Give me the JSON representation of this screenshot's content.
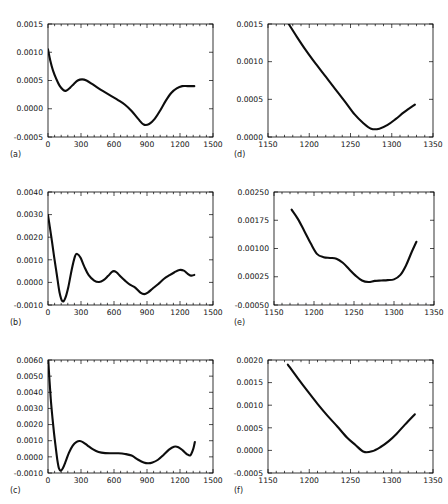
{
  "figure": {
    "background": "#ffffff",
    "curve_color": "#0d0d0d",
    "axis_color": "#000000",
    "panel_count": 6
  },
  "panels": [
    {
      "id": "a",
      "label": "(a)"
    },
    {
      "id": "b",
      "label": "(b)"
    },
    {
      "id": "c",
      "label": "(c)"
    },
    {
      "id": "d",
      "label": "(d)"
    },
    {
      "id": "e",
      "label": "(e)"
    },
    {
      "id": "f",
      "label": "(f)"
    }
  ],
  "chart_data": [
    {
      "type": "line",
      "panel": "a",
      "title": "",
      "xlabel": "",
      "ylabel": "",
      "xlim": [
        0,
        1500
      ],
      "ylim": [
        -0.0005,
        0.0015
      ],
      "xticks": [
        0,
        300,
        600,
        900,
        1200,
        1500
      ],
      "xticklabels": [
        "0",
        "300",
        "600",
        "900",
        "1200",
        "1500"
      ],
      "yticks": [
        -0.0005,
        0.0,
        0.0005,
        0.001,
        0.0015
      ],
      "yticklabels": [
        "-0.0005",
        "0.0000",
        "0.0005",
        "0.0010",
        "0.0015"
      ],
      "grid": false,
      "legend": null,
      "minor_ticks": true,
      "x": [
        0,
        20,
        45,
        75,
        105,
        140,
        165,
        200,
        235,
        270,
        310,
        350,
        400,
        460,
        520,
        580,
        640,
        700,
        760,
        820,
        870,
        920,
        970,
        1020,
        1070,
        1120,
        1170,
        1220,
        1270,
        1330
      ],
      "y": [
        0.00105,
        0.00086,
        0.00068,
        0.00053,
        0.00041,
        0.00033,
        0.00032,
        0.00037,
        0.00044,
        0.0005,
        0.00052,
        0.0005,
        0.00044,
        0.00036,
        0.00029,
        0.00022,
        0.00015,
        7e-05,
        -4e-05,
        -0.00018,
        -0.00028,
        -0.00027,
        -0.00018,
        -3e-05,
        0.00014,
        0.00028,
        0.00036,
        0.0004,
        0.0004,
        0.0004
      ]
    },
    {
      "type": "line",
      "panel": "b",
      "title": "",
      "xlabel": "",
      "ylabel": "",
      "xlim": [
        0,
        1500
      ],
      "ylim": [
        -0.001,
        0.004
      ],
      "xticks": [
        0,
        300,
        600,
        900,
        1200,
        1500
      ],
      "xticklabels": [
        "0",
        "300",
        "600",
        "900",
        "1200",
        "1500"
      ],
      "yticks": [
        -0.001,
        0.0,
        0.001,
        0.002,
        0.003,
        0.004
      ],
      "yticklabels": [
        "-0.0010",
        "0.0000",
        "0.0010",
        "0.0020",
        "0.0030",
        "0.0040"
      ],
      "grid": false,
      "legend": null,
      "minor_ticks": true,
      "x": [
        0,
        15,
        35,
        55,
        80,
        105,
        130,
        155,
        185,
        215,
        245,
        265,
        295,
        330,
        370,
        420,
        465,
        505,
        545,
        580,
        600,
        625,
        660,
        700,
        745,
        790,
        840,
        875,
        910,
        950,
        1000,
        1055,
        1105,
        1150,
        1195,
        1235,
        1270,
        1300,
        1330
      ],
      "y": [
        0.00298,
        0.0025,
        0.00185,
        0.00115,
        0.00035,
        -0.00045,
        -0.00083,
        -0.00072,
        -0.0002,
        0.00055,
        0.00115,
        0.00126,
        0.0011,
        0.0007,
        0.00032,
        8e-05,
        2e-05,
        0.0001,
        0.00028,
        0.00046,
        0.0005,
        0.00044,
        0.00026,
        8e-05,
        -0.0001,
        -0.00022,
        -0.00045,
        -0.00052,
        -0.00044,
        -0.00028,
        -8e-05,
        0.00016,
        0.00032,
        0.00045,
        0.00055,
        0.00052,
        0.00038,
        0.0003,
        0.00033
      ]
    },
    {
      "type": "line",
      "panel": "c",
      "title": "",
      "xlabel": "",
      "ylabel": "",
      "xlim": [
        0,
        1500
      ],
      "ylim": [
        -0.001,
        0.006
      ],
      "xticks": [
        0,
        300,
        600,
        900,
        1200,
        1500
      ],
      "xticklabels": [
        "0",
        "300",
        "600",
        "900",
        "1200",
        "1500"
      ],
      "yticks": [
        -0.001,
        0.0,
        0.001,
        0.002,
        0.003,
        0.004,
        0.005,
        0.006
      ],
      "yticklabels": [
        "-0.0010",
        "0.0000",
        "0.0010",
        "0.0020",
        "0.0030",
        "0.0040",
        "0.0050",
        "0.0060"
      ],
      "grid": false,
      "legend": null,
      "minor_ticks": true,
      "x": [
        0,
        12,
        25,
        40,
        55,
        70,
        85,
        100,
        115,
        135,
        160,
        190,
        225,
        260,
        290,
        320,
        360,
        410,
        460,
        520,
        580,
        640,
        700,
        760,
        820,
        870,
        910,
        950,
        1000,
        1050,
        1100,
        1145,
        1185,
        1225,
        1265,
        1295,
        1320,
        1335
      ],
      "y": [
        0.0063,
        0.0049,
        0.0036,
        0.00245,
        0.00145,
        0.0006,
        -0.0002,
        -0.00072,
        -0.00085,
        -0.0007,
        -0.0003,
        0.00025,
        0.0007,
        0.00093,
        0.00098,
        0.0009,
        0.0007,
        0.00046,
        0.0003,
        0.00023,
        0.00022,
        0.00022,
        0.00018,
        8e-05,
        -0.00018,
        -0.00035,
        -0.0004,
        -0.00035,
        -0.00018,
        0.00012,
        0.00045,
        0.00063,
        0.0006,
        0.0004,
        0.00016,
        0.0001,
        0.00048,
        0.00092
      ]
    },
    {
      "type": "line",
      "panel": "d",
      "title": "",
      "xlabel": "",
      "ylabel": "",
      "xlim": [
        1150,
        1350
      ],
      "ylim": [
        0.0,
        0.0015
      ],
      "xticks": [
        1150,
        1200,
        1250,
        1300,
        1350
      ],
      "xticklabels": [
        "1150",
        "1200",
        "1250",
        "1300",
        "1350"
      ],
      "yticks": [
        0.0,
        0.0005,
        0.001,
        0.0015
      ],
      "yticklabels": [
        "0.0000",
        "0.0005",
        "0.0010",
        "0.0015"
      ],
      "grid": false,
      "legend": null,
      "minor_ticks": true,
      "x": [
        1174,
        1185,
        1196,
        1208,
        1220,
        1232,
        1244,
        1255,
        1265,
        1275,
        1285,
        1295,
        1305,
        1315,
        1328
      ],
      "y": [
        0.00152,
        0.00133,
        0.00115,
        0.00097,
        0.0008,
        0.00063,
        0.00046,
        0.0003,
        0.00019,
        0.00011,
        0.00011,
        0.00016,
        0.00024,
        0.00033,
        0.00043
      ]
    },
    {
      "type": "line",
      "panel": "e",
      "title": "",
      "xlabel": "",
      "ylabel": "",
      "xlim": [
        1150,
        1350
      ],
      "ylim": [
        -0.0005,
        0.0025
      ],
      "xticks": [
        1150,
        1200,
        1250,
        1300,
        1350
      ],
      "xticklabels": [
        "1150",
        "1200",
        "1250",
        "1300",
        "1350"
      ],
      "yticks": [
        -0.0005,
        0.00025,
        0.001,
        0.00175,
        0.0025
      ],
      "yticklabels": [
        "-0.00050",
        "0.00025",
        "0.00100",
        "0.00175",
        "0.00250"
      ],
      "grid": false,
      "legend": null,
      "minor_ticks": true,
      "x": [
        1172,
        1180,
        1188,
        1196,
        1204,
        1212,
        1220,
        1228,
        1236,
        1244,
        1252,
        1260,
        1268,
        1276,
        1284,
        1292,
        1300,
        1308,
        1315,
        1322,
        1328
      ],
      "y": [
        0.00203,
        0.00178,
        0.00146,
        0.00113,
        0.00085,
        0.00077,
        0.00075,
        0.00073,
        0.00062,
        0.00045,
        0.00028,
        0.00015,
        0.00011,
        0.00014,
        0.00015,
        0.00016,
        0.00018,
        0.0003,
        0.00055,
        0.0009,
        0.00118
      ]
    },
    {
      "type": "line",
      "panel": "f",
      "title": "",
      "xlabel": "",
      "ylabel": "",
      "xlim": [
        1150,
        1350
      ],
      "ylim": [
        -0.0005,
        0.002
      ],
      "xticks": [
        1150,
        1200,
        1250,
        1300,
        1350
      ],
      "xticklabels": [
        "1150",
        "1200",
        "1250",
        "1300",
        "1350"
      ],
      "yticks": [
        -0.0005,
        0.0,
        0.0005,
        0.001,
        0.0015,
        0.002
      ],
      "yticklabels": [
        "-0.0005",
        "0.0000",
        "0.0005",
        "0.0010",
        "0.0015",
        "0.0020"
      ],
      "grid": false,
      "legend": null,
      "minor_ticks": true,
      "x": [
        1174,
        1186,
        1198,
        1210,
        1222,
        1234,
        1246,
        1256,
        1266,
        1276,
        1286,
        1296,
        1306,
        1316,
        1328
      ],
      "y": [
        0.0019,
        0.0016,
        0.00131,
        0.00103,
        0.00077,
        0.00053,
        0.00028,
        0.00012,
        -3e-05,
        -2e-05,
        7e-05,
        0.0002,
        0.00037,
        0.00057,
        0.0008
      ]
    }
  ]
}
